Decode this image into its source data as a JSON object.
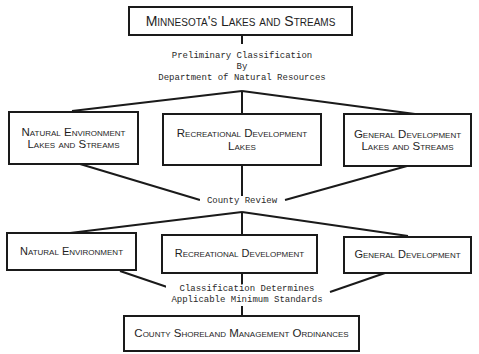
{
  "title_box": {
    "label": "Minnesota's Lakes and Streams"
  },
  "stage1_label": {
    "line1": "Preliminary Classification",
    "line2": "By",
    "line3": "Department of Natural Resources"
  },
  "preliminary_classes": [
    {
      "line1": "Natural Environment",
      "line2": "Lakes and Streams"
    },
    {
      "line1": "Recreational Development",
      "line2": "Lakes"
    },
    {
      "line1": "General Development",
      "line2": "Lakes and Streams"
    }
  ],
  "stage2_label": {
    "text": "County Review"
  },
  "final_classes": [
    {
      "label": "Natural Environment"
    },
    {
      "label": "Recreational Development"
    },
    {
      "label": "General Development"
    }
  ],
  "stage3_label": {
    "line1": "Classification Determines",
    "line2": "Applicable Minimum Standards"
  },
  "result_box": {
    "label": "County Shoreland Management Ordinances"
  }
}
